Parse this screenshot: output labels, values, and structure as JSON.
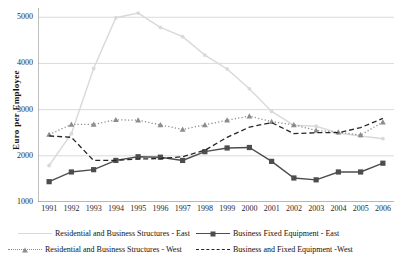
{
  "chart_data": {
    "type": "line",
    "title": "",
    "xlabel": "",
    "ylabel": "Euro per Employee",
    "ylim": [
      1000,
      5200
    ],
    "yticks": [
      1000,
      2000,
      3000,
      4000,
      5000
    ],
    "grid": true,
    "legend_position": "bottom",
    "categories": [
      "1991",
      "1992",
      "1993",
      "1994",
      "1995",
      "1996",
      "1997",
      "1998",
      "1999",
      "2000",
      "2001",
      "2002",
      "2003",
      "2004",
      "2005",
      "2006"
    ],
    "series": [
      {
        "name": "Residential and Business Structures - East",
        "color": "#d9d9d9",
        "style": "solid",
        "marker": "circle",
        "values": [
          1790,
          2480,
          3890,
          4990,
          5090,
          4780,
          4580,
          4180,
          3880,
          3450,
          2960,
          2660,
          2640,
          2490,
          2430,
          2370
        ]
      },
      {
        "name": "Business Fixed Equipment - East",
        "color": "#4d4d4d",
        "style": "solid",
        "marker": "square",
        "values": [
          1440,
          1650,
          1700,
          1900,
          1980,
          1970,
          1900,
          2090,
          2170,
          2180,
          1880,
          1520,
          1480,
          1650,
          1650,
          1840
        ]
      },
      {
        "name": "Residential and Business Structures - West",
        "color": "#8c8c8c",
        "style": "dotted",
        "marker": "triangle",
        "values": [
          2460,
          2680,
          2680,
          2780,
          2770,
          2670,
          2570,
          2670,
          2770,
          2860,
          2740,
          2670,
          2550,
          2510,
          2450,
          2730
        ]
      },
      {
        "name": "Business and Fixed Equipment - West",
        "color": "#262626",
        "style": "dashed",
        "marker": "none",
        "values": [
          2430,
          2400,
          1900,
          1900,
          1930,
          1940,
          1980,
          2120,
          2400,
          2620,
          2720,
          2480,
          2500,
          2500,
          2610,
          2810
        ]
      }
    ]
  },
  "axis": {
    "ylabel": "Euro per Employee",
    "yticks": [
      "5000",
      "4000",
      "3000",
      "2000",
      "1000"
    ],
    "xticks": [
      "1991",
      "1992",
      "1993",
      "1994",
      "1995",
      "1996",
      "1997",
      "1998",
      "1999",
      "2000",
      "2001",
      "2002",
      "2003",
      "2004",
      "2005",
      "2006"
    ]
  },
  "legend": {
    "items": [
      {
        "label": "Residential and Business Structures - East",
        "icon": "light-gray-line-icon"
      },
      {
        "label": "Business Fixed Equipment - East",
        "icon": "dark-square-line-icon"
      },
      {
        "label": "Residential and Business Structures - West",
        "icon": "gray-dotted-triangle-icon"
      },
      {
        "label": "Business and Fixed Equipment -West",
        "icon": "black-dashed-line-icon"
      }
    ]
  }
}
